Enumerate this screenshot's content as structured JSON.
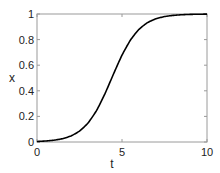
{
  "chart_data": {
    "type": "line",
    "title": "",
    "xlabel": "t",
    "ylabel": "x",
    "xlim": [
      0,
      10
    ],
    "ylim": [
      0,
      1
    ],
    "xticks": [
      0,
      5,
      10
    ],
    "yticks": [
      0,
      0.2,
      0.4,
      0.6,
      0.8,
      1
    ],
    "xtick_labels": [
      "0",
      "5",
      "10"
    ],
    "ytick_labels": [
      "0",
      "0.2",
      "0.4",
      "0.6",
      "0.8",
      "1"
    ],
    "grid": false,
    "legend": null,
    "series": [
      {
        "name": "x(t)",
        "color": "#000000",
        "x": [
          0,
          0.5,
          1,
          1.5,
          2,
          2.5,
          3,
          3.5,
          4,
          4.5,
          5,
          5.5,
          6,
          6.5,
          7,
          7.5,
          8,
          8.5,
          9,
          9.5,
          10
        ],
        "y": [
          0.004,
          0.008,
          0.014,
          0.026,
          0.047,
          0.085,
          0.148,
          0.245,
          0.378,
          0.531,
          0.678,
          0.796,
          0.88,
          0.933,
          0.963,
          0.98,
          0.989,
          0.994,
          0.997,
          0.998,
          0.999
        ]
      }
    ]
  }
}
